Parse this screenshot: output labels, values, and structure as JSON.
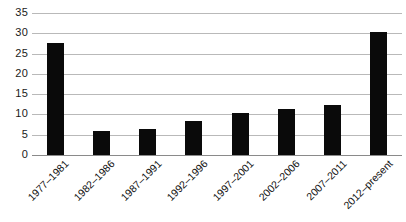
{
  "chart_data": {
    "type": "bar",
    "title": "",
    "subtitle": "",
    "xlabel": "",
    "ylabel": "",
    "ylim": [
      0,
      35
    ],
    "yticks": [
      0,
      5,
      10,
      15,
      20,
      25,
      30,
      35
    ],
    "ytick_labels": [
      "0",
      "5",
      "10",
      "15",
      "20",
      "25",
      "30",
      "35"
    ],
    "grid": "horizontal",
    "legend": "none",
    "bar_color": "#0a0a0a",
    "gridline_color": "#b9b9b9",
    "categories": [
      "1977–1981",
      "1982–1986",
      "1987–1991",
      "1992–1996",
      "1997–2001",
      "2002–2006",
      "2007–2011",
      "2012–present"
    ],
    "values": [
      27.7,
      5.8,
      6.4,
      8.5,
      10.4,
      11.3,
      12.3,
      30.2
    ],
    "x_tick_rotation_deg": -45
  }
}
